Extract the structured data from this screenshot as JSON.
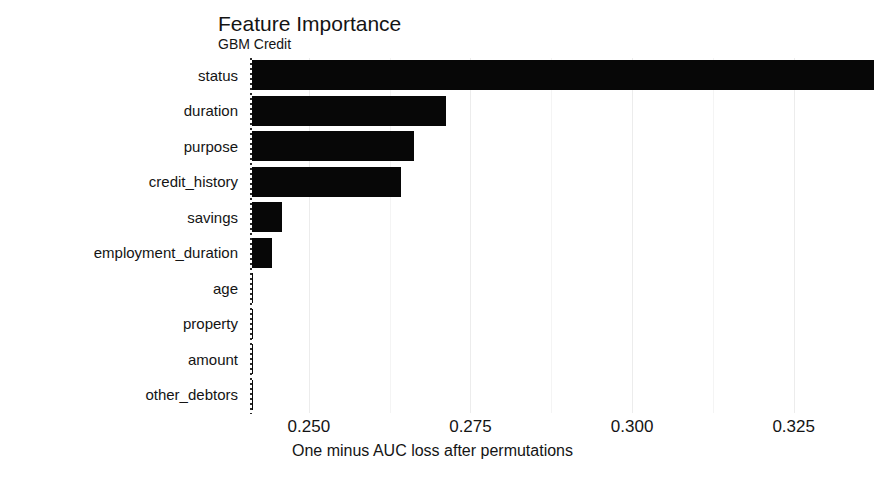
{
  "chart_data": {
    "type": "bar",
    "orientation": "horizontal",
    "title": "Feature Importance",
    "subtitle": "GBM Credit",
    "xlabel": "One minus AUC loss after permutations",
    "ylabel": "",
    "categories": [
      "status",
      "duration",
      "purpose",
      "credit_history",
      "savings",
      "employment_duration",
      "age",
      "property",
      "amount",
      "other_debtors"
    ],
    "values": [
      0.3375,
      0.2712,
      0.2663,
      0.2642,
      0.2459,
      0.2443,
      0.24,
      0.2396,
      0.2395,
      0.2397
    ],
    "xlim": [
      0.2412,
      0.3365
    ],
    "xticks": [
      0.25,
      0.275,
      0.3,
      0.325
    ],
    "xticklabels": [
      "0.250",
      "0.275",
      "0.300",
      "0.325"
    ],
    "grid": true,
    "grid_axis": "x",
    "legend": false,
    "bar_color": "#070707",
    "grid_color": "#ececec",
    "background": "#ffffff",
    "series": [
      {
        "name": "importance",
        "values": [
          0.3375,
          0.2712,
          0.2663,
          0.2642,
          0.2459,
          0.2443,
          0.24,
          0.2396,
          0.2395,
          0.2397
        ]
      }
    ]
  },
  "axis": {
    "x_tick_0": "0.250",
    "x_tick_1": "0.275",
    "x_tick_2": "0.300",
    "x_tick_3": "0.325",
    "x_title": "One minus AUC loss after permutations"
  },
  "labels": {
    "f0": "status",
    "f1": "duration",
    "f2": "purpose",
    "f3": "credit_history",
    "f4": "savings",
    "f5": "employment_duration",
    "f6": "age",
    "f7": "property",
    "f8": "amount",
    "f9": "other_debtors"
  },
  "header": {
    "title": "Feature Importance",
    "subtitle": "GBM Credit"
  }
}
